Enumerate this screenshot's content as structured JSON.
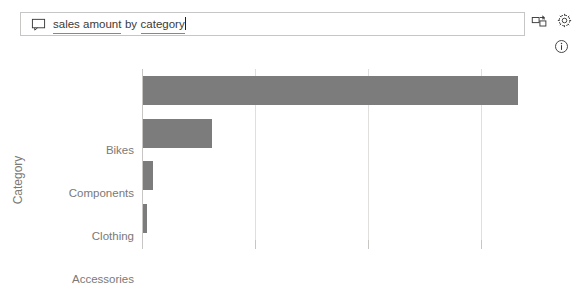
{
  "qna": {
    "icon": "qna-chat-icon",
    "placeholder": "Ask a question about your data",
    "value": "sales amount by category",
    "tokens": [
      {
        "text": "sales amount",
        "entity": true
      },
      {
        "text": "by",
        "entity": false
      },
      {
        "text": "category",
        "entity": true
      }
    ],
    "actions": [
      {
        "name": "add-to-report-icon",
        "label": "Add visual to report"
      },
      {
        "name": "gear-icon",
        "label": "Settings"
      },
      {
        "name": "info-icon",
        "label": "Information"
      }
    ]
  },
  "colors": {
    "bar": "#7c7c7c",
    "axis": "#c8c6c4",
    "gridline": "#e1dfdd",
    "text": "#7a7977",
    "input_text": "#3b3a39",
    "input_border": "#c8c6c4",
    "background": "#ffffff"
  },
  "chart_data": {
    "type": "bar",
    "orientation": "horizontal",
    "title": "",
    "xlabel": "Sales Amount",
    "ylabel": "Category",
    "categories": [
      "Bikes",
      "Components",
      "Clothing",
      "Accessories"
    ],
    "values": [
      66400000,
      12200000,
      1800000,
      700000
    ],
    "value_labels": [
      "66.4M",
      "12.2M",
      "1.8M",
      "0.7M"
    ],
    "xlim": [
      0,
      70700000
    ],
    "xticks": [
      0,
      20000000,
      40000000,
      60000000
    ],
    "xticklabels": [
      "0M",
      "20M",
      "40M",
      "60M"
    ],
    "grid": true,
    "legend": false,
    "series": [
      {
        "name": "Sales Amount",
        "values": [
          66400000,
          12200000,
          1800000,
          700000
        ]
      }
    ]
  }
}
